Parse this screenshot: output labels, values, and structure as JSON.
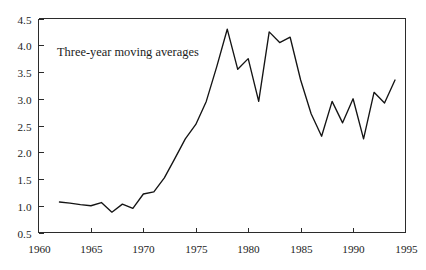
{
  "chart_data": {
    "type": "line",
    "title": "",
    "subtitle": "",
    "xlabel": "",
    "ylabel": "",
    "annotation": "Three-year moving averages",
    "grid": false,
    "legend": null,
    "xlim": [
      1960,
      1995
    ],
    "ylim": [
      0.5,
      4.5
    ],
    "xticks": [
      1960,
      1965,
      1970,
      1975,
      1980,
      1985,
      1990,
      1995
    ],
    "xticklabels": [
      "1960",
      "1965",
      "1970",
      "1975",
      "1980",
      "1985",
      "1990",
      "1995"
    ],
    "yticks": [
      0.5,
      1.0,
      1.5,
      2.0,
      2.5,
      3.0,
      3.5,
      4.0,
      4.5
    ],
    "yticklabels": [
      "0.5",
      "1.0",
      "1.5",
      "2.0",
      "2.5",
      "3.0",
      "3.5",
      "4.0",
      "4.5"
    ],
    "series": [
      {
        "name": "Three-year moving averages",
        "color": "#141414",
        "x": [
          1962,
          1963,
          1964,
          1965,
          1966,
          1967,
          1968,
          1969,
          1970,
          1971,
          1972,
          1973,
          1974,
          1975,
          1976,
          1977,
          1978,
          1979,
          1980,
          1981,
          1982,
          1983,
          1984,
          1985,
          1986,
          1987,
          1988,
          1989,
          1990,
          1991,
          1992,
          1993,
          1994
        ],
        "y": [
          1.07,
          1.05,
          1.02,
          1.0,
          1.06,
          0.88,
          1.03,
          0.95,
          1.22,
          1.26,
          1.52,
          1.88,
          2.25,
          2.52,
          2.95,
          3.6,
          4.3,
          3.55,
          3.75,
          2.95,
          4.25,
          4.05,
          4.15,
          3.35,
          2.72,
          2.3,
          2.95,
          2.55,
          3.0,
          2.25,
          3.12,
          2.92,
          3.35
        ]
      }
    ]
  },
  "axes": {
    "box_color": "#2b2b2b"
  }
}
